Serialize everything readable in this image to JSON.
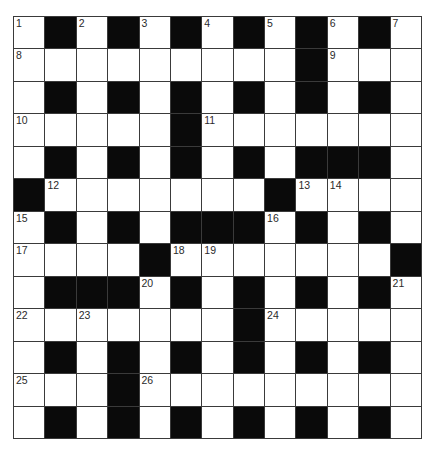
{
  "puzzle": {
    "rows": 13,
    "cols": 13,
    "colors": {
      "block": "#0a0a0a",
      "cell": "#ffffff",
      "line": "#3a3a3a",
      "number": "#2a2a2a"
    },
    "grid": [
      "W.W.W.W.W.W.W",
      "WWWWWWWWW.WWW",
      "W.W.W.W.W.W.W",
      "WWWWW.WWWWWWW",
      "W.W.W.W.W...W",
      ".WWWWWWW.WWWW",
      "W.W.W...W.W.W",
      "WWWW.WWWWWWW.",
      "W...W.W.W.W.W",
      "WWWWWWW.WWWWW",
      "W.W.W.W.W.W.W",
      "WWW.WWWWWWWWW",
      "W.W.W.W.W.W.W"
    ],
    "numbers": [
      {
        "row": 0,
        "col": 0,
        "n": "1"
      },
      {
        "row": 0,
        "col": 2,
        "n": "2"
      },
      {
        "row": 0,
        "col": 4,
        "n": "3"
      },
      {
        "row": 0,
        "col": 6,
        "n": "4"
      },
      {
        "row": 0,
        "col": 8,
        "n": "5"
      },
      {
        "row": 0,
        "col": 10,
        "n": "6"
      },
      {
        "row": 0,
        "col": 12,
        "n": "7"
      },
      {
        "row": 1,
        "col": 0,
        "n": "8"
      },
      {
        "row": 1,
        "col": 10,
        "n": "9"
      },
      {
        "row": 3,
        "col": 0,
        "n": "10"
      },
      {
        "row": 3,
        "col": 6,
        "n": "11"
      },
      {
        "row": 5,
        "col": 1,
        "n": "12"
      },
      {
        "row": 5,
        "col": 9,
        "n": "13"
      },
      {
        "row": 5,
        "col": 10,
        "n": "14"
      },
      {
        "row": 6,
        "col": 0,
        "n": "15"
      },
      {
        "row": 6,
        "col": 8,
        "n": "16"
      },
      {
        "row": 7,
        "col": 0,
        "n": "17"
      },
      {
        "row": 7,
        "col": 5,
        "n": "18"
      },
      {
        "row": 7,
        "col": 6,
        "n": "19"
      },
      {
        "row": 8,
        "col": 4,
        "n": "20"
      },
      {
        "row": 8,
        "col": 12,
        "n": "21"
      },
      {
        "row": 9,
        "col": 0,
        "n": "22"
      },
      {
        "row": 9,
        "col": 2,
        "n": "23"
      },
      {
        "row": 9,
        "col": 8,
        "n": "24"
      },
      {
        "row": 11,
        "col": 0,
        "n": "25"
      },
      {
        "row": 11,
        "col": 4,
        "n": "26"
      }
    ]
  }
}
